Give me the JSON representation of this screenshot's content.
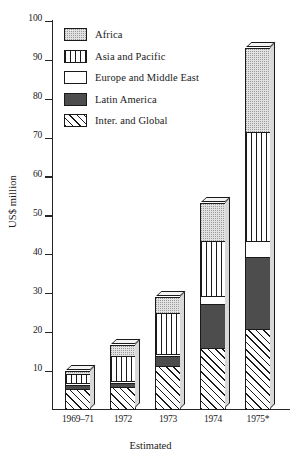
{
  "chart_data": {
    "type": "bar",
    "stacked": true,
    "title": "",
    "xlabel": "Estimated",
    "ylabel": "US$ million",
    "ylim": [
      0,
      100
    ],
    "yticks": [
      10,
      20,
      30,
      40,
      50,
      60,
      70,
      80,
      90,
      100
    ],
    "grid": false,
    "legend_position": "upper-left inside plot",
    "categories": [
      "1969–71",
      "1972",
      "1973",
      "1974",
      "1975*"
    ],
    "series": [
      {
        "name": "Inter. and Global",
        "pattern": "diagonal-hatch",
        "values": [
          5.0,
          5.5,
          11.0,
          15.5,
          20.5
        ]
      },
      {
        "name": "Latin America",
        "pattern": "solid-dark",
        "values": [
          1.0,
          1.0,
          2.5,
          11.5,
          18.5
        ]
      },
      {
        "name": "Europe and Middle East",
        "pattern": "white",
        "values": [
          0.5,
          0.5,
          0.5,
          2.0,
          4.0
        ]
      },
      {
        "name": "Asia and Pacific",
        "pattern": "vertical-lines",
        "values": [
          2.5,
          6.5,
          10.5,
          14.0,
          28.0
        ]
      },
      {
        "name": "Africa",
        "pattern": "stipple",
        "values": [
          1.0,
          3.0,
          4.5,
          10.0,
          22.0
        ]
      }
    ],
    "totals": [
      10.0,
      16.5,
      29.0,
      53.0,
      93.0
    ],
    "annotations": [
      "* denotes estimated figure for 1975"
    ]
  },
  "legend": {
    "items": [
      {
        "label": "Africa",
        "icon": "swatch-stipple-icon"
      },
      {
        "label": "Asia and Pacific",
        "icon": "swatch-vertical-lines-icon"
      },
      {
        "label": "Europe and Middle East",
        "icon": "swatch-white-icon"
      },
      {
        "label": "Latin America",
        "icon": "swatch-solid-dark-icon"
      },
      {
        "label": "Inter. and Global",
        "icon": "swatch-diagonal-hatch-icon"
      }
    ]
  },
  "colors": {
    "africa": "#e2e2e2",
    "asia": "#ffffff",
    "europe": "#ffffff",
    "latin_america": "#4d4d4d",
    "inter_global": "#ffffff",
    "outline": "#1a1a1a",
    "background": "#ffffff"
  }
}
